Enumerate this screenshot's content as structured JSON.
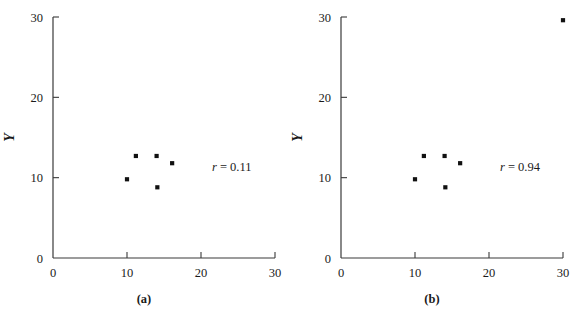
{
  "figure": {
    "background": "#ffffff",
    "ink_color": "#1a1a1a",
    "point_color": "#111111"
  },
  "chart_data": [
    {
      "type": "scatter",
      "panel": "a",
      "caption": "(a)",
      "title": "",
      "xlabel": "X",
      "ylabel": "Y",
      "xlim": [
        0,
        30
      ],
      "ylim": [
        0,
        30
      ],
      "xticks": [
        0,
        10,
        20,
        30
      ],
      "yticks": [
        0,
        10,
        20,
        30
      ],
      "xtick_labels": [
        "0",
        "10",
        "20",
        "30"
      ],
      "ytick_labels": [
        "0",
        "10",
        "20",
        "30"
      ],
      "grid": false,
      "legend": "none",
      "annotation": "r = 0.11",
      "annotation_symbol": "r",
      "annotation_operator": "=",
      "annotation_value": "0.11",
      "annotation_x": 21.5,
      "annotation_y": 10.8,
      "points": [
        {
          "x": 10.0,
          "y": 9.8
        },
        {
          "x": 11.2,
          "y": 12.7
        },
        {
          "x": 14.0,
          "y": 12.7
        },
        {
          "x": 14.1,
          "y": 8.8
        },
        {
          "x": 16.1,
          "y": 11.8
        }
      ]
    },
    {
      "type": "scatter",
      "panel": "b",
      "caption": "(b)",
      "title": "",
      "xlabel": "X",
      "ylabel": "Y",
      "xlim": [
        0,
        30
      ],
      "ylim": [
        0,
        30
      ],
      "xticks": [
        0,
        10,
        20,
        30
      ],
      "yticks": [
        0,
        10,
        20,
        30
      ],
      "xtick_labels": [
        "0",
        "10",
        "20",
        "30"
      ],
      "ytick_labels": [
        "0",
        "10",
        "20",
        "30"
      ],
      "grid": false,
      "legend": "none",
      "annotation": "r = 0.94",
      "annotation_symbol": "r",
      "annotation_operator": "=",
      "annotation_value": "0.94",
      "annotation_x": 21.5,
      "annotation_y": 10.8,
      "points": [
        {
          "x": 10.0,
          "y": 9.8
        },
        {
          "x": 11.2,
          "y": 12.7
        },
        {
          "x": 14.0,
          "y": 12.7
        },
        {
          "x": 14.1,
          "y": 8.8
        },
        {
          "x": 16.1,
          "y": 11.8
        },
        {
          "x": 30.0,
          "y": 29.6
        }
      ]
    }
  ]
}
